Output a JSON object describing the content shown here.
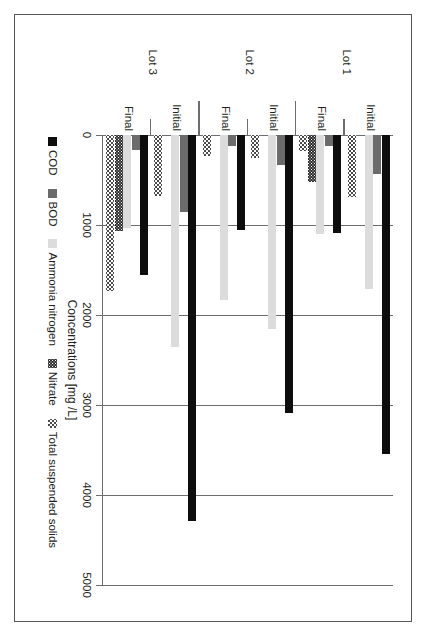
{
  "chart_data": {
    "type": "bar",
    "orientation": "horizontal",
    "title": "",
    "xlabel": "Concentrations [mg /L]",
    "ylabel": "",
    "xlim": [
      0,
      5000
    ],
    "tick_labels": [
      "0",
      "1000",
      "2000",
      "3000",
      "4000",
      "5000"
    ],
    "tick_values": [
      0,
      1000,
      2000,
      3000,
      4000,
      5000
    ],
    "grid": true,
    "legend_position": "bottom",
    "groups": [
      "Lot 1",
      "Lot 2",
      "Lot 3"
    ],
    "categories": [
      "Initial",
      "Final",
      "Initial",
      "Final",
      "Initial",
      "Final"
    ],
    "series": [
      {
        "name": "COD",
        "color": "#0d0d0d",
        "values": [
          3545,
          1090,
          3090,
          1050,
          4290,
          1550
        ]
      },
      {
        "name": "BOD",
        "color": "#6b6b6b",
        "values": [
          430,
          120,
          330,
          120,
          860,
          170
        ]
      },
      {
        "name": "Ammonia nitrogen",
        "color": "#dcdcdc",
        "values": [
          1710,
          1100,
          2150,
          1830,
          2350,
          1030
        ]
      },
      {
        "name": "Nitrate",
        "color": "#2b2b2b",
        "values": [
          0,
          520,
          0,
          0,
          0,
          1070
        ]
      },
      {
        "name": "Total suspended solids",
        "color": "#4a4a4a",
        "values": [
          690,
          180,
          260,
          230,
          680,
          1730
        ]
      }
    ]
  },
  "axis": {
    "value_axis_title": "Concentrations [mg /L]"
  },
  "legend": {
    "items": [
      {
        "label": "COD"
      },
      {
        "label": "BOD"
      },
      {
        "label": "Ammonia nitrogen"
      },
      {
        "label": "Nitrate"
      },
      {
        "label": "Total suspended solids"
      }
    ]
  },
  "category_axis": {
    "groups": [
      {
        "label": "Lot 1",
        "subcategories": [
          "Initial",
          "Final"
        ]
      },
      {
        "label": "Lot 2",
        "subcategories": [
          "Initial",
          "Final"
        ]
      },
      {
        "label": "Lot 3",
        "subcategories": [
          "Initial",
          "Final"
        ]
      }
    ]
  }
}
